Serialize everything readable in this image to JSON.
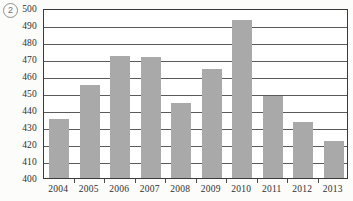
{
  "figure": {
    "item_marker": "2"
  },
  "chart_data": {
    "type": "bar",
    "title": "",
    "subtitle": "",
    "xlabel": "",
    "ylabel": "",
    "categories": [
      "2004",
      "2005",
      "2006",
      "2007",
      "2008",
      "2009",
      "2010",
      "2011",
      "2012",
      "2013"
    ],
    "values": [
      435,
      455,
      472,
      471,
      444,
      464,
      493,
      448,
      433,
      422
    ],
    "series": [
      {
        "name": "",
        "values": [
          435,
          455,
          472,
          471,
          444,
          464,
          493,
          448,
          433,
          422
        ]
      }
    ],
    "ylim": [
      400,
      500
    ],
    "ytick_step": 10,
    "yticks": [
      400,
      410,
      420,
      430,
      440,
      450,
      460,
      470,
      480,
      490,
      500
    ],
    "ytick_labels": [
      "400",
      "410",
      "420",
      "430",
      "440",
      "450",
      "460",
      "470",
      "480",
      "490",
      "500"
    ],
    "grid": true,
    "grid_axis": "y",
    "legend": false,
    "legend_position": "none",
    "bar_color": "#a9a9a9",
    "axis_color": "#3b3b3b",
    "gridline_color": "#5a5a5a",
    "background_color": "#ffffff",
    "annotations": []
  }
}
